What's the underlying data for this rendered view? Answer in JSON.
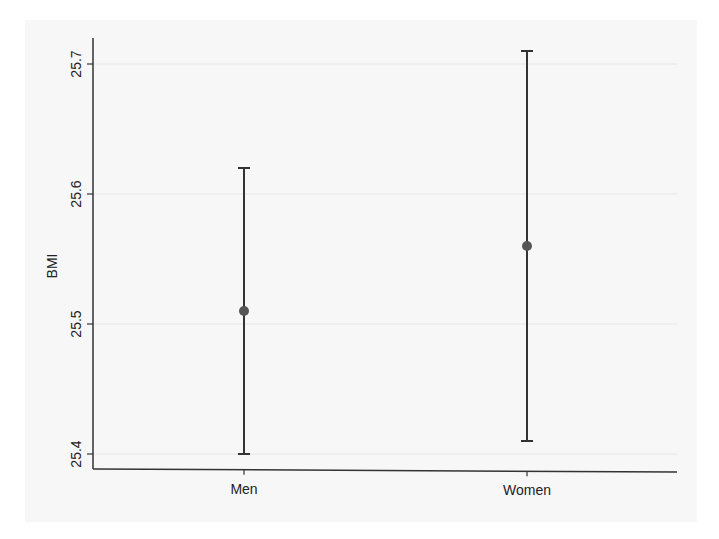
{
  "chart_data": {
    "type": "scatter",
    "subtype": "point-with-error-bars",
    "title": "",
    "xlabel": "",
    "ylabel": "BMI",
    "categories": [
      "Men",
      "Women"
    ],
    "series": [
      {
        "name": "BMI mean with 95% CI",
        "values": [
          25.51,
          25.56
        ],
        "ci_lower": [
          25.4,
          25.41
        ],
        "ci_upper": [
          25.62,
          25.71
        ]
      }
    ],
    "ylim": [
      25.39,
      25.72
    ],
    "yticks": [
      25.4,
      25.5,
      25.6,
      25.7
    ],
    "ytick_labels": [
      "25.4",
      "25.5",
      "25.6",
      "25.7"
    ],
    "grid": true,
    "legend": "none"
  },
  "colors": {
    "background": "#ffffff",
    "frame": "#f7f7f7",
    "axis": "#333333",
    "grid": "#e6e6e6",
    "marker": "#555555",
    "errorbar": "#333333"
  }
}
